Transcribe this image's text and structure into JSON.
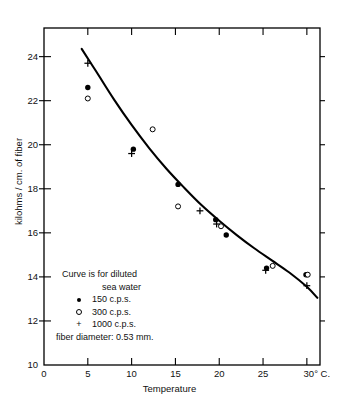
{
  "chart_data": {
    "type": "scatter",
    "title": "",
    "xlabel": "Temperature",
    "ylabel": "kilohms / cm. of fiber",
    "xlim": [
      0,
      31.5
    ],
    "ylim": [
      10,
      25.3
    ],
    "grid": false,
    "legend_position": "lower-left-inside",
    "x_ticks": [
      0,
      5,
      10,
      15,
      20,
      25,
      30
    ],
    "x_tick_labels": [
      "0",
      "5",
      "10",
      "15",
      "20",
      "25",
      "30° C."
    ],
    "y_ticks": [
      10,
      12,
      14,
      16,
      18,
      20,
      22,
      24
    ],
    "y_tick_labels": [
      "10",
      "12",
      "14",
      "16",
      "18",
      "20",
      "22",
      "24"
    ],
    "series": [
      {
        "name": "150 c.p.s.",
        "marker": "filled-circle",
        "points": [
          {
            "x": 5.0,
            "y": 22.6
          },
          {
            "x": 10.2,
            "y": 19.8
          },
          {
            "x": 15.3,
            "y": 18.2
          },
          {
            "x": 19.6,
            "y": 16.6
          },
          {
            "x": 20.8,
            "y": 15.9
          },
          {
            "x": 25.4,
            "y": 14.4
          },
          {
            "x": 29.9,
            "y": 14.1
          }
        ]
      },
      {
        "name": "300 c.p.s.",
        "marker": "open-circle",
        "points": [
          {
            "x": 5.0,
            "y": 22.1
          },
          {
            "x": 12.4,
            "y": 20.7
          },
          {
            "x": 15.3,
            "y": 17.2
          },
          {
            "x": 20.2,
            "y": 16.3
          },
          {
            "x": 26.1,
            "y": 14.5
          },
          {
            "x": 30.1,
            "y": 14.1
          }
        ]
      },
      {
        "name": "1000 c.p.s.",
        "marker": "plus",
        "points": [
          {
            "x": 5.0,
            "y": 23.7
          },
          {
            "x": 10.0,
            "y": 19.6
          },
          {
            "x": 17.8,
            "y": 17.0
          },
          {
            "x": 19.7,
            "y": 16.4
          },
          {
            "x": 25.3,
            "y": 14.3
          },
          {
            "x": 30.0,
            "y": 13.6
          }
        ]
      }
    ],
    "fitted_curve": {
      "name": "Curve is for diluted sea water",
      "points": [
        {
          "x": 4.3,
          "y": 24.35
        },
        {
          "x": 6.0,
          "y": 23.3
        },
        {
          "x": 8.0,
          "y": 22.05
        },
        {
          "x": 10.0,
          "y": 20.9
        },
        {
          "x": 12.0,
          "y": 19.85
        },
        {
          "x": 14.0,
          "y": 18.9
        },
        {
          "x": 16.0,
          "y": 18.05
        },
        {
          "x": 18.0,
          "y": 17.25
        },
        {
          "x": 20.0,
          "y": 16.55
        },
        {
          "x": 22.0,
          "y": 15.9
        },
        {
          "x": 24.0,
          "y": 15.3
        },
        {
          "x": 26.0,
          "y": 14.75
        },
        {
          "x": 28.0,
          "y": 14.2
        },
        {
          "x": 30.0,
          "y": 13.55
        },
        {
          "x": 31.2,
          "y": 13.05
        }
      ]
    },
    "annotations": {
      "caption_line1": "Curve is for diluted",
      "caption_line2": "sea water",
      "legend_entry_1": "150 c.p.s.",
      "legend_entry_2": "300 c.p.s.",
      "legend_entry_3": "1000 c.p.s.",
      "footnote": "fiber diameter: 0.53 mm."
    },
    "colors": {
      "axis": "#000000",
      "curve": "#000000",
      "marker": "#000000",
      "background": "#ffffff"
    }
  }
}
